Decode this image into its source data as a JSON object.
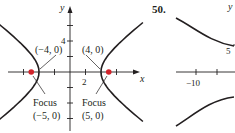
{
  "figure_left": {
    "x_axis_label": "x",
    "y_axis_label": "y",
    "x_tick_label": "2",
    "y_tick_label": "4",
    "x_ticks": [
      -6,
      -2,
      2,
      6
    ],
    "y_ticks": [
      -6,
      -4,
      -2,
      2,
      4,
      6
    ],
    "hyperbola": {
      "a": 4,
      "b": 3,
      "center": [
        0,
        0
      ],
      "orientation": "horizontal"
    },
    "vertices": [
      {
        "label": "(−4, 0)",
        "x": -4,
        "y": 0
      },
      {
        "label": "(4, 0)",
        "x": 4,
        "y": 0
      }
    ],
    "foci": [
      {
        "title": "Focus",
        "label": "(−5, 0)",
        "x": -5,
        "y": 0
      },
      {
        "title": "Focus",
        "label": "(5, 0)",
        "x": 5,
        "y": 0
      }
    ],
    "focus_color": "#d2232a"
  },
  "figure_right": {
    "problem_number": "50.",
    "y_axis_label": "y",
    "x_tick_label": "−10",
    "y_tick_label": "5"
  }
}
